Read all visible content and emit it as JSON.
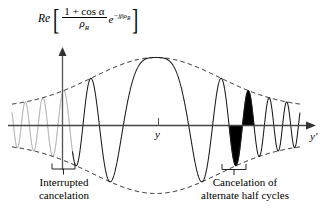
{
  "figure": {
    "title_formula": {
      "operator": "Re",
      "bracket_open": "[",
      "bracket_close": "]",
      "numerator": "1 + cos α",
      "denominator": "ρ",
      "denominator_sub": "R",
      "exponential_base": "e",
      "exponential_exponent": "−jβρ",
      "exponential_exponent_sub": "R",
      "plain": "Re[ (1 + cos α) / ρ_R · e^(−jβρ_R) ]"
    },
    "axes": {
      "vertical_axis_name": "amplitude-axis",
      "horizontal_axis_label": "y′",
      "origin_tick_label": "y"
    },
    "annotations": [
      {
        "id": "left",
        "line1": "Interrupted",
        "line2": "cancelation"
      },
      {
        "id": "right",
        "line1": "Cancelation of",
        "line2": "alternate half cycles"
      }
    ],
    "colors": {
      "curve": "#1a1a1a",
      "faded_curve": "#9a9a9a",
      "envelope": "#1a1a1a",
      "axis": "#444444",
      "fill_highlight": "#000000",
      "background": "#ffffff"
    }
  },
  "chart_data": {
    "type": "line",
    "xlabel": "y′",
    "ylabel": "Re[ (1 + cos α)/ρ_R e^(−jβρ_R) ]",
    "xlim": [
      -1.0,
      1.0
    ],
    "ylim": [
      -1.15,
      1.15
    ],
    "grid": false,
    "legend": false,
    "series": [
      {
        "name": "oscillation",
        "style": "solid",
        "model": "envelope(x) * cos( k * x * |x| )",
        "envelope_model": "A * exp( -(x/0.62)^2 ) + A0",
        "envelope_peak": 1.0,
        "envelope_edge": 0.26,
        "chirp_coefficient_k": 30.5
      },
      {
        "name": "upper-envelope",
        "style": "dashed",
        "model": "+envelope(x)"
      },
      {
        "name": "lower-envelope",
        "style": "dashed",
        "model": "-envelope(x)"
      }
    ],
    "annotated_regions": [
      {
        "label": "Interrupted cancelation",
        "x_center": -0.56,
        "note": "left-hand region where the oscillation is drawn faded / interrupted"
      },
      {
        "label": "Cancelation of alternate half cycles",
        "x_center": 0.54,
        "note": "one full cycle (positive and negative half lobe) is filled solid black"
      }
    ],
    "filled_cycle": {
      "x_start": 0.46,
      "x_end": 0.62,
      "color": "#000000"
    },
    "faded_region": {
      "x_start": -1.0,
      "x_end": -0.58,
      "color": "#9a9a9a"
    },
    "origin_tick": {
      "x": 0.0,
      "label": "y"
    }
  }
}
